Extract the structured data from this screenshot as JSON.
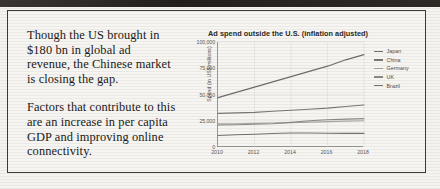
{
  "document": {
    "paragraphs": [
      "Though the US brought in $180 bn in global ad revenue, the Chinese market is closing the gap.",
      "Factors that contribute to this are an increase in per capita GDP and improving online connectivity."
    ]
  },
  "chart_data": {
    "type": "line",
    "title": "Ad spend outside the U.S. (inflation adjusted)",
    "xlabel": "",
    "ylabel": "Spend (in US$ millions)",
    "x": [
      2010,
      2011,
      2012,
      2013,
      2014,
      2015,
      2016,
      2017,
      2018
    ],
    "xticks": [
      "2010",
      "2012",
      "2014",
      "2016",
      "2018"
    ],
    "yticks": [
      "0",
      "25,000",
      "50,000",
      "75,000",
      "100,000"
    ],
    "xlim": [
      2010,
      2018
    ],
    "ylim": [
      0,
      100000
    ],
    "grid": true,
    "legend_position": "right",
    "series": [
      {
        "name": "Japan",
        "color": "#6f6d69",
        "values": [
          47000,
          52000,
          57000,
          62000,
          67000,
          72000,
          77000,
          83000,
          88000
        ]
      },
      {
        "name": "China",
        "color": "#7a7874",
        "values": [
          32000,
          32500,
          33000,
          34000,
          35000,
          36000,
          37000,
          38500,
          40000
        ]
      },
      {
        "name": "Germany",
        "color": "#a9a7a3",
        "values": [
          22000,
          22200,
          22500,
          22800,
          23200,
          23700,
          24200,
          24600,
          25000
        ]
      },
      {
        "name": "UK",
        "color": "#8d8b87",
        "values": [
          21000,
          21200,
          21600,
          22200,
          23500,
          25000,
          26000,
          26500,
          27000
        ]
      },
      {
        "name": "Brazil",
        "color": "#74726e",
        "values": [
          11000,
          11600,
          12200,
          12800,
          13400,
          13300,
          13100,
          13000,
          13000
        ]
      }
    ]
  }
}
